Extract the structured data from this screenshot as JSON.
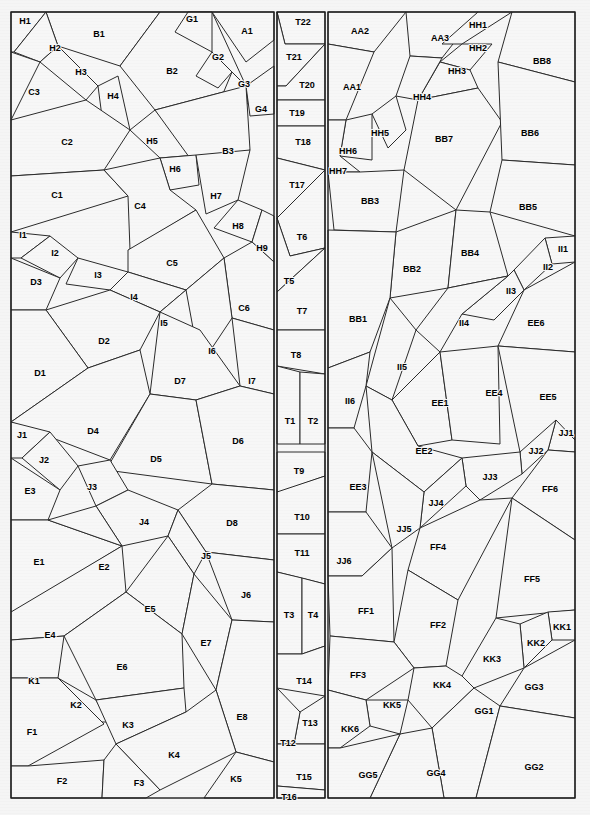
{
  "document": {
    "title": "Polygon Partition Diagram",
    "description": "Three vertical panels subdivided into labeled convex polygon cells",
    "canvas": {
      "width": 590,
      "height": 815
    },
    "colors": {
      "page_background": "#f5f5f5",
      "panel_fill": "#f7f7f7",
      "cell_stroke": "#2b2b2b",
      "frame_stroke": "#1e1e1e",
      "label_text": "#000000"
    }
  },
  "panels": [
    {
      "name": "left-panel",
      "x": 11,
      "y": 12,
      "width": 263,
      "height": 786
    },
    {
      "name": "middle-panel",
      "x": 277,
      "y": 12,
      "width": 48,
      "height": 786
    },
    {
      "name": "right-panel",
      "x": 328,
      "y": 12,
      "width": 247,
      "height": 786
    }
  ],
  "cells": [
    {
      "label": "H1",
      "lx": 25,
      "ly": 22,
      "points": "11,12 46,12 14,52 11,52"
    },
    {
      "label": "B1",
      "lx": 99,
      "ly": 35,
      "points": "46,12 160,12 120,66 58,46"
    },
    {
      "label": "H2",
      "lx": 55,
      "ly": 49,
      "points": "46,12 58,46 40,62 14,52"
    },
    {
      "label": "H3",
      "lx": 81,
      "ly": 73,
      "points": "58,46 98,86 86,100 40,62"
    },
    {
      "label": "C3",
      "lx": 34,
      "ly": 93,
      "points": "11,52 40,62 11,120"
    },
    {
      "label": "B2",
      "lx": 172,
      "ly": 72,
      "points": "160,12 212,12 246,86 155,110 120,66"
    },
    {
      "label": "G1",
      "lx": 192,
      "ly": 20,
      "points": "188,12 212,12 212,52 175,32"
    },
    {
      "label": "A1",
      "lx": 247,
      "ly": 32,
      "points": "212,12 274,12 274,40 246,62"
    },
    {
      "label": "G2",
      "lx": 218,
      "ly": 58,
      "points": "212,52 232,72 218,88 196,76"
    },
    {
      "label": "G3",
      "lx": 244,
      "ly": 85,
      "points": "232,72 246,86 248,104 222,96"
    },
    {
      "label": "G4",
      "lx": 261,
      "ly": 110,
      "points": "246,86 274,66 274,114 250,116"
    },
    {
      "label": "H4",
      "lx": 113,
      "ly": 97,
      "points": "98,86 118,76 130,130 104,132"
    },
    {
      "label": "C2",
      "lx": 67,
      "ly": 143,
      "points": "11,120 86,100 130,130 104,170 11,176"
    },
    {
      "label": "H5",
      "lx": 152,
      "ly": 142,
      "points": "130,130 155,110 196,155 160,158"
    },
    {
      "label": "B3",
      "lx": 228,
      "ly": 152,
      "points": "155,110 246,86 250,150 200,172"
    },
    {
      "label": "H6",
      "lx": 175,
      "ly": 170,
      "points": "160,158 196,155 199,185 170,190"
    },
    {
      "label": "C1",
      "lx": 57,
      "ly": 196,
      "points": "11,176 104,170 128,196 11,232"
    },
    {
      "label": "C4",
      "lx": 140,
      "ly": 207,
      "points": "104,170 160,158 170,190 196,210 130,250 128,196"
    },
    {
      "label": "H7",
      "lx": 216,
      "ly": 197,
      "points": "196,155 250,150 238,200 206,214"
    },
    {
      "label": "H8",
      "lx": 238,
      "ly": 227,
      "points": "238,200 262,210 252,242 214,228"
    },
    {
      "label": "H9",
      "lx": 262,
      "ly": 249,
      "points": "262,210 274,216 274,262 252,242"
    },
    {
      "label": "I1",
      "lx": 23,
      "ly": 236,
      "points": "11,232 50,236 21,258 11,258"
    },
    {
      "label": "I2",
      "lx": 55,
      "ly": 254,
      "points": "50,236 78,258 60,278 21,258"
    },
    {
      "label": "I3",
      "lx": 98,
      "ly": 276,
      "points": "78,258 128,272 110,290 66,284"
    },
    {
      "label": "D3",
      "lx": 36,
      "ly": 283,
      "points": "11,258 60,278 46,310 11,310"
    },
    {
      "label": "C5",
      "lx": 172,
      "ly": 264,
      "points": "128,250 196,210 224,258 186,290 128,272"
    },
    {
      "label": "C6",
      "lx": 244,
      "ly": 309,
      "points": "224,258 252,242 274,262 274,330 232,318"
    },
    {
      "label": "I4",
      "lx": 134,
      "ly": 298,
      "points": "128,272 186,290 160,312 110,290"
    },
    {
      "label": "I5",
      "lx": 164,
      "ly": 324,
      "points": "160,312 186,290 200,330 172,344"
    },
    {
      "label": "I6",
      "lx": 212,
      "ly": 352,
      "points": "186,290 224,258 232,318 200,366"
    },
    {
      "label": "I7",
      "lx": 252,
      "ly": 382,
      "points": "232,318 274,330 274,394 240,386"
    },
    {
      "label": "D2",
      "lx": 104,
      "ly": 342,
      "points": "46,310 110,290 160,312 140,350 88,368"
    },
    {
      "label": "D1",
      "lx": 40,
      "ly": 374,
      "points": "11,310 46,310 88,368 11,422"
    },
    {
      "label": "D7",
      "lx": 180,
      "ly": 382,
      "points": "160,312 200,330 240,386 196,400 150,394"
    },
    {
      "label": "D4",
      "lx": 93,
      "ly": 432,
      "points": "11,422 88,368 140,350 150,394 110,460"
    },
    {
      "label": "D5",
      "lx": 156,
      "ly": 460,
      "points": "150,394 196,400 212,484 106,470"
    },
    {
      "label": "D6",
      "lx": 238,
      "ly": 442,
      "points": "196,400 240,386 274,394 274,490 212,484"
    },
    {
      "label": "J1",
      "lx": 22,
      "ly": 436,
      "points": "11,422 50,432 22,458 11,458"
    },
    {
      "label": "J2",
      "lx": 44,
      "ly": 461,
      "points": "50,432 78,466 60,490 22,458"
    },
    {
      "label": "J3",
      "lx": 92,
      "ly": 488,
      "points": "78,466 110,460 128,490 96,506"
    },
    {
      "label": "E3",
      "lx": 30,
      "ly": 492,
      "points": "11,458 60,490 48,520 11,520"
    },
    {
      "label": "J4",
      "lx": 144,
      "ly": 523,
      "points": "96,506 128,490 178,510 168,536 122,546"
    },
    {
      "label": "D8",
      "lx": 232,
      "ly": 524,
      "points": "178,510 212,484 274,490 274,560 206,552"
    },
    {
      "label": "J5",
      "lx": 206,
      "ly": 557,
      "points": "168,536 178,510 206,552 194,574"
    },
    {
      "label": "J6",
      "lx": 246,
      "ly": 596,
      "points": "206,552 274,560 274,622 232,620"
    },
    {
      "label": "E1",
      "lx": 39,
      "ly": 563,
      "points": "11,520 48,520 122,546 14,612 11,612"
    },
    {
      "label": "E2",
      "lx": 104,
      "ly": 568,
      "points": "48,520 96,506 122,546"
    },
    {
      "label": "E4",
      "lx": 50,
      "ly": 636,
      "points": "11,612 122,546 126,592 64,636 11,640"
    },
    {
      "label": "E5",
      "lx": 150,
      "ly": 610,
      "points": "126,592 168,536 194,574 182,634"
    },
    {
      "label": "E6",
      "lx": 122,
      "ly": 668,
      "points": "64,636 126,592 182,634 184,688 96,700"
    },
    {
      "label": "E7",
      "lx": 206,
      "ly": 644,
      "points": "182,634 194,574 232,620 216,690"
    },
    {
      "label": "E8",
      "lx": 242,
      "ly": 718,
      "points": "216,690 232,620 274,622 274,762 236,752"
    },
    {
      "label": "K1",
      "lx": 34,
      "ly": 682,
      "points": "11,640 64,636 58,678 11,678"
    },
    {
      "label": "K2",
      "lx": 76,
      "ly": 706,
      "points": "58,678 96,700 108,722 64,722"
    },
    {
      "label": "K3",
      "lx": 128,
      "ly": 726,
      "points": "96,700 184,688 186,712 116,744"
    },
    {
      "label": "K4",
      "lx": 174,
      "ly": 756,
      "points": "116,744 186,712 216,690 236,752 160,790"
    },
    {
      "label": "K5",
      "lx": 236,
      "ly": 780,
      "points": "236,752 274,762 274,798 204,798"
    },
    {
      "label": "F1",
      "lx": 32,
      "ly": 733,
      "points": "11,678 58,678 104,724 28,766 11,766"
    },
    {
      "label": "F2",
      "lx": 62,
      "ly": 782,
      "points": "11,766 28,766 104,760 102,798 11,798"
    },
    {
      "label": "F3",
      "lx": 139,
      "ly": 784,
      "points": "104,760 116,744 160,790 146,798 102,798"
    },
    {
      "label": "T22",
      "lx": 303,
      "ly": 23,
      "points": "277,12 325,12 325,44 285,44"
    },
    {
      "label": "T21",
      "lx": 294,
      "ly": 58,
      "points": "277,12 285,44 325,44 286,86 277,86"
    },
    {
      "label": "T20",
      "lx": 307,
      "ly": 86,
      "points": "286,86 325,44 325,100 277,100 277,86"
    },
    {
      "label": "T19",
      "lx": 297,
      "ly": 114,
      "points": "277,100 325,100 325,126 277,126"
    },
    {
      "label": "T18",
      "lx": 303,
      "ly": 143,
      "points": "277,126 325,126 325,170 277,158"
    },
    {
      "label": "T17",
      "lx": 297,
      "ly": 186,
      "points": "277,158 325,170 277,218"
    },
    {
      "label": "T6",
      "lx": 302,
      "ly": 238,
      "points": "277,218 325,170 325,248 290,256"
    },
    {
      "label": "T5",
      "lx": 289,
      "ly": 282,
      "points": "277,218 290,256 325,248 277,292"
    },
    {
      "label": "T7",
      "lx": 302,
      "ly": 312,
      "points": "277,292 325,248 325,330 277,330"
    },
    {
      "label": "T8",
      "lx": 296,
      "ly": 356,
      "points": "277,330 325,330 325,374 277,366"
    },
    {
      "label": "T1",
      "lx": 290,
      "ly": 422,
      "points": "277,366 300,372 300,444 277,444"
    },
    {
      "label": "T2",
      "lx": 313,
      "ly": 422,
      "points": "300,372 325,374 325,444 300,444"
    },
    {
      "label": "T9",
      "lx": 299,
      "ly": 472,
      "points": "277,452 325,452 325,476 280,492 277,492"
    },
    {
      "label": "T10",
      "lx": 302,
      "ly": 518,
      "points": "277,492 325,476 325,534 277,534"
    },
    {
      "label": "T11",
      "lx": 302,
      "ly": 554,
      "points": "277,534 325,534 325,584 277,572"
    },
    {
      "label": "T3",
      "lx": 289,
      "ly": 616,
      "points": "277,572 302,578 302,654 277,654"
    },
    {
      "label": "T4",
      "lx": 313,
      "ly": 616,
      "points": "302,578 325,584 325,646 302,654"
    },
    {
      "label": "T14",
      "lx": 304,
      "ly": 682,
      "points": "277,654 302,654 325,646 325,696 277,688"
    },
    {
      "label": "T13",
      "lx": 310,
      "ly": 724,
      "points": "300,712 325,696 325,744 294,744"
    },
    {
      "label": "T12",
      "lx": 288,
      "ly": 744,
      "points": "277,688 300,712 294,744 277,744"
    },
    {
      "label": "T15",
      "lx": 304,
      "ly": 778,
      "points": "277,744 325,744 325,790 277,786"
    },
    {
      "label": "T16",
      "lx": 289,
      "ly": 798,
      "points": "277,786 325,790 325,798 277,798"
    },
    {
      "label": "AA2",
      "lx": 360,
      "ly": 32,
      "points": "328,12 406,12 374,52 328,44"
    },
    {
      "label": "AA3",
      "lx": 440,
      "ly": 39,
      "points": "406,12 478,12 442,58 410,56"
    },
    {
      "label": "HH1",
      "lx": 478,
      "ly": 26,
      "points": "478,12 512,12 462,44 442,44"
    },
    {
      "label": "HH2",
      "lx": 478,
      "ly": 49,
      "points": "462,44 492,44 470,70 440,62"
    },
    {
      "label": "BB8",
      "lx": 542,
      "ly": 62,
      "points": "512,12 575,12 575,82 498,62"
    },
    {
      "label": "AA1",
      "lx": 352,
      "ly": 88,
      "points": "328,44 374,52 346,120 328,120"
    },
    {
      "label": "HH3",
      "lx": 457,
      "ly": 72,
      "points": "440,62 470,70 478,88 418,100"
    },
    {
      "label": "HH4",
      "lx": 422,
      "ly": 98,
      "points": "410,56 442,58 418,100 396,96"
    },
    {
      "label": "HH5",
      "lx": 380,
      "ly": 134,
      "points": "372,114 396,96 406,130 388,148"
    },
    {
      "label": "HH6",
      "lx": 348,
      "ly": 152,
      "points": "346,120 372,114 372,160 340,156"
    },
    {
      "label": "HH7",
      "lx": 338,
      "ly": 172,
      "points": "328,120 346,120 340,156 360,172 328,172"
    },
    {
      "label": "BB7",
      "lx": 444,
      "ly": 140,
      "points": "418,100 478,88 502,122 456,210 404,170"
    },
    {
      "label": "BB6",
      "lx": 530,
      "ly": 134,
      "points": "498,62 575,82 575,165 502,160"
    },
    {
      "label": "BB5",
      "lx": 528,
      "ly": 208,
      "points": "502,160 575,165 575,236 490,212"
    },
    {
      "label": "BB3",
      "lx": 370,
      "ly": 202,
      "points": "328,172 360,172 404,170 396,232 334,230"
    },
    {
      "label": "BB2",
      "lx": 412,
      "ly": 270,
      "points": "396,232 456,210 448,288 390,298"
    },
    {
      "label": "BB4",
      "lx": 470,
      "ly": 254,
      "points": "456,210 490,212 508,276 448,288"
    },
    {
      "label": "BB1",
      "lx": 358,
      "ly": 320,
      "points": "328,230 396,232 390,298 370,352 328,368"
    },
    {
      "label": "II1",
      "lx": 563,
      "ly": 250,
      "points": "545,238 575,236 575,262 552,264"
    },
    {
      "label": "II2",
      "lx": 548,
      "ly": 268,
      "points": "545,238 552,264 524,290 514,270"
    },
    {
      "label": "II3",
      "lx": 511,
      "ly": 292,
      "points": "508,276 514,270 524,290 494,320 462,314"
    },
    {
      "label": "II4",
      "lx": 464,
      "ly": 324,
      "points": "448,288 508,276 462,314 440,352 416,330"
    },
    {
      "label": "EE6",
      "lx": 536,
      "ly": 324,
      "points": "524,290 575,262 575,352 498,346"
    },
    {
      "label": "II5",
      "lx": 402,
      "ly": 368,
      "points": "390,298 416,330 392,400 366,386"
    },
    {
      "label": "II6",
      "lx": 350,
      "ly": 402,
      "points": "328,368 370,352 366,386 354,428 328,428"
    },
    {
      "label": "EE1",
      "lx": 440,
      "ly": 404,
      "points": "392,400 440,352 452,440 418,446"
    },
    {
      "label": "EE4",
      "lx": 494,
      "ly": 394,
      "points": "440,352 498,346 500,444 452,440"
    },
    {
      "label": "EE5",
      "lx": 548,
      "ly": 398,
      "points": "498,346 575,352 575,440 520,452"
    },
    {
      "label": "EE2",
      "lx": 424,
      "ly": 452,
      "points": "366,386 392,400 418,446 462,458 424,492 372,452"
    },
    {
      "label": "EE3",
      "lx": 358,
      "ly": 488,
      "points": "328,428 354,428 372,452 366,512 328,512"
    },
    {
      "label": "JJ1",
      "lx": 566,
      "ly": 434,
      "points": "556,420 575,440 575,452 548,450"
    },
    {
      "label": "JJ2",
      "lx": 536,
      "ly": 452,
      "points": "520,452 556,420 548,450 522,474"
    },
    {
      "label": "JJ3",
      "lx": 490,
      "ly": 478,
      "points": "462,458 520,452 522,474 480,500 466,486"
    },
    {
      "label": "JJ4",
      "lx": 436,
      "ly": 504,
      "points": "424,492 462,458 466,486 420,528"
    },
    {
      "label": "JJ5",
      "lx": 404,
      "ly": 530,
      "points": "372,452 424,492 420,528 392,548"
    },
    {
      "label": "JJ6",
      "lx": 344,
      "ly": 562,
      "points": "328,512 366,512 392,548 362,576 328,576"
    },
    {
      "label": "FF6",
      "lx": 550,
      "ly": 490,
      "points": "548,450 575,452 575,540 512,498"
    },
    {
      "label": "FF4",
      "lx": 438,
      "ly": 548,
      "points": "420,528 480,500 512,498 458,600 408,570"
    },
    {
      "label": "FF5",
      "lx": 532,
      "ly": 580,
      "points": "512,498 575,540 575,610 496,618"
    },
    {
      "label": "FF1",
      "lx": 366,
      "ly": 612,
      "points": "328,576 362,576 392,548 394,642 330,636"
    },
    {
      "label": "FF2",
      "lx": 438,
      "ly": 626,
      "points": "394,642 408,570 458,600 446,666 414,668"
    },
    {
      "label": "KK1",
      "lx": 562,
      "ly": 628,
      "points": "548,612 575,610 575,640 552,640"
    },
    {
      "label": "KK2",
      "lx": 536,
      "ly": 644,
      "points": "520,624 548,612 552,640 524,668"
    },
    {
      "label": "KK3",
      "lx": 492,
      "ly": 660,
      "points": "496,618 520,624 524,668 474,688 462,676"
    },
    {
      "label": "KK4",
      "lx": 442,
      "ly": 686,
      "points": "414,668 446,666 462,676 474,688 432,728 408,700"
    },
    {
      "label": "FF3",
      "lx": 358,
      "ly": 676,
      "points": "330,636 394,642 414,668 366,700 328,690"
    },
    {
      "label": "KK5",
      "lx": 392,
      "ly": 706,
      "points": "366,700 408,700 400,734 370,726"
    },
    {
      "label": "KK6",
      "lx": 350,
      "ly": 730,
      "points": "328,690 366,700 370,726 340,748 328,748"
    },
    {
      "label": "GG3",
      "lx": 534,
      "ly": 688,
      "points": "524,668 575,640 575,718 500,706"
    },
    {
      "label": "GG1",
      "lx": 484,
      "ly": 712,
      "points": "432,728 474,688 500,706 476,798 444,798"
    },
    {
      "label": "GG2",
      "lx": 534,
      "ly": 768,
      "points": "500,706 575,718 575,798 476,798"
    },
    {
      "label": "GG4",
      "lx": 436,
      "ly": 774,
      "points": "400,734 432,728 444,798 370,798"
    },
    {
      "label": "GG5",
      "lx": 368,
      "ly": 776,
      "points": "328,748 340,748 400,734 370,798 328,798"
    }
  ]
}
